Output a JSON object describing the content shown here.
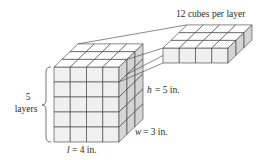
{
  "diagram": {
    "slab_label": "12 cubes per layer",
    "layers_count": "5",
    "layers_word": "layers",
    "height_var": "h",
    "height_value": "= 5 in.",
    "width_var": "w",
    "width_value": "= 3 in.",
    "length_var": "l",
    "length_value": "= 4 in.",
    "dimensions": {
      "length": 4,
      "width": 3,
      "height": 5,
      "unit": "in."
    },
    "cubes_per_layer": 12,
    "colors": {
      "front_face": "#f0f0f0",
      "top_face": "#ffffff",
      "side_face": "#d4d4d4",
      "stroke": "#3a3a3a"
    }
  }
}
